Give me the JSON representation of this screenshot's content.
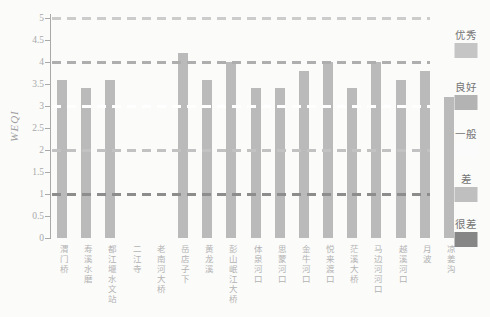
{
  "chart_data": {
    "type": "bar",
    "title": "",
    "ylabel": "WEQI",
    "xlabel": "",
    "ylim": [
      0,
      5
    ],
    "yticks": [
      "0",
      "0.5",
      "1",
      "1.5",
      "2",
      "2.5",
      "3",
      "3.5",
      "4",
      "4.5",
      "5"
    ],
    "grid": "horizontal dashed threshold lines at 1,2,3,4,5",
    "legend_position": "right",
    "categories": [
      "渭门桥",
      "寿溪水磨",
      "都江堰水文站",
      "二江寺",
      "老南河大桥",
      "岳店子下",
      "黄龙溪",
      "彭山岷江大桥",
      "体泉河口",
      "思蒙河口",
      "金牛河口",
      "悦来渡口",
      "茫溪大桥",
      "马边河河口",
      "越溪河口",
      "月波",
      "凉姜沟"
    ],
    "values": [
      3.6,
      3.4,
      3.6,
      null,
      null,
      4.2,
      3.6,
      4.0,
      3.4,
      3.4,
      3.8,
      4.0,
      3.4,
      4.0,
      3.6,
      3.8,
      3.2
    ],
    "bar_color": "#bababa",
    "axis_color": "#a9a9a9",
    "tick_label_color": "#a9a9a9",
    "xlabel_color": "#b3b3b3",
    "legend_text_color": "#757575",
    "thresholds": [
      {
        "key": "excellent",
        "label": "优秀",
        "value": 5,
        "line_color": "#cccccc",
        "swatch_color": "#c5c5c5"
      },
      {
        "key": "good",
        "label": "良好",
        "value": 4,
        "line_color": "#aeaeae",
        "swatch_color": "#b3b3b3"
      },
      {
        "key": "average",
        "label": "一般",
        "value": 3,
        "line_color": "#ffffff",
        "swatch_color": "#fbfbfb"
      },
      {
        "key": "poor",
        "label": "差",
        "value": 2,
        "line_color": "#c2c2c2",
        "swatch_color": "#bfbfbf"
      },
      {
        "key": "very-poor",
        "label": "很差",
        "value": 1,
        "line_color": "#8d8d8d",
        "swatch_color": "#868686"
      }
    ]
  }
}
